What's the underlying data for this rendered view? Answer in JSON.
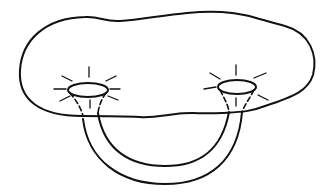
{
  "diagram": {
    "stroke_color": "#111111",
    "background": "#ffffff",
    "elements": {
      "surface": "blob-outline",
      "openings": [
        "left-opening",
        "right-opening"
      ],
      "handle": "tube-handle",
      "rays": "radiating-lines"
    }
  }
}
